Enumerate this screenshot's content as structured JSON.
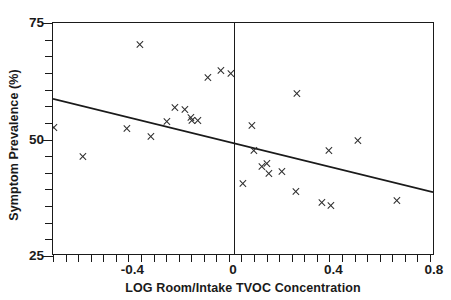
{
  "chart_data": {
    "type": "scatter",
    "title": "",
    "xlabel": "LOG Room/Intake TVOC Concentration",
    "ylabel": "Symptom Prevalence (%)",
    "xlim": [
      -0.72,
      0.8
    ],
    "ylim": [
      25,
      75
    ],
    "grid": false,
    "legend": null,
    "x_ticks_major": [
      -0.4,
      0,
      0.4,
      0.8
    ],
    "x_tick_labels": [
      "-0.4",
      "0",
      "0.4",
      "0.8"
    ],
    "x_tick_minor_step": 0.05,
    "y_ticks_major": [
      25,
      50,
      75
    ],
    "y_tick_labels": [
      "25",
      "50",
      "75"
    ],
    "y_tick_minor_step": 3.571,
    "marker": "x",
    "marker_color": "#2b2b2b",
    "points": [
      {
        "x": -0.715,
        "y": 52.6
      },
      {
        "x": -0.6,
        "y": 46.3
      },
      {
        "x": -0.425,
        "y": 52.4
      },
      {
        "x": -0.372,
        "y": 70.3
      },
      {
        "x": -0.33,
        "y": 50.7
      },
      {
        "x": -0.268,
        "y": 53.9
      },
      {
        "x": -0.235,
        "y": 56.8
      },
      {
        "x": -0.193,
        "y": 56.5
      },
      {
        "x": -0.172,
        "y": 54.7
      },
      {
        "x": -0.168,
        "y": 54.1
      },
      {
        "x": -0.145,
        "y": 54.1
      },
      {
        "x": -0.105,
        "y": 63.3
      },
      {
        "x": -0.052,
        "y": 64.7
      },
      {
        "x": -0.012,
        "y": 64.1
      },
      {
        "x": 0.038,
        "y": 40.6
      },
      {
        "x": 0.072,
        "y": 53.0
      },
      {
        "x": 0.08,
        "y": 47.7
      },
      {
        "x": 0.11,
        "y": 44.2
      },
      {
        "x": 0.132,
        "y": 44.8
      },
      {
        "x": 0.138,
        "y": 42.6
      },
      {
        "x": 0.192,
        "y": 43.2
      },
      {
        "x": 0.248,
        "y": 38.9
      },
      {
        "x": 0.25,
        "y": 59.8
      },
      {
        "x": 0.352,
        "y": 36.4
      },
      {
        "x": 0.378,
        "y": 47.7
      },
      {
        "x": 0.385,
        "y": 35.8
      },
      {
        "x": 0.492,
        "y": 49.8
      },
      {
        "x": 0.648,
        "y": 37.0
      }
    ],
    "fit_line": {
      "type": "linear-regression",
      "x_start": -0.72,
      "y_start": 58.6,
      "x_end": 0.8,
      "y_end": 38.4,
      "color": "#1a1a1a"
    },
    "reference_lines": [
      {
        "orientation": "vertical",
        "x": 0,
        "color": "#1a1a1a"
      }
    ]
  },
  "axis_titles": {
    "x": "LOG Room/Intake TVOC Concentration",
    "y": "Symptom Prevalence (%)"
  }
}
